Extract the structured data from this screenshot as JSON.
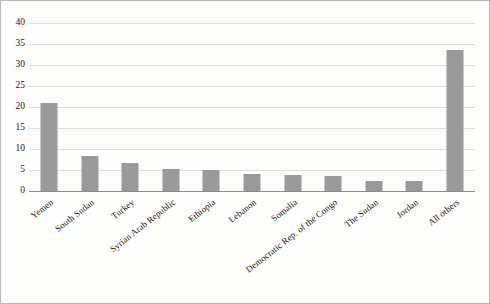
{
  "chart_data": {
    "type": "bar",
    "title": "",
    "subtitle": "",
    "xlabel": "",
    "ylabel": "",
    "ylim": [
      0,
      40
    ],
    "ytick_step": 5,
    "yticks": [
      0,
      5,
      10,
      15,
      20,
      25,
      30,
      35,
      40
    ],
    "grid": true,
    "legend": false,
    "categories": [
      "Yemen",
      "South Sudan",
      "Turkey",
      "Syrian Arab Republic",
      "Ethiopia",
      "Lebanon",
      "Somalia",
      "Democratic Rep. of the Congo",
      "The Sudan",
      "Jordan",
      "All others"
    ],
    "values": [
      20.9,
      8.3,
      6.6,
      5.2,
      5.1,
      4.1,
      3.9,
      3.5,
      2.3,
      2.3,
      33.6
    ],
    "bar_color": "#9a9a9a",
    "gridline_color": "#dcdcdc",
    "axis_color": "#8a8a8a",
    "background_color": "#fdfdfc",
    "border_color": "#b9b9b9"
  }
}
